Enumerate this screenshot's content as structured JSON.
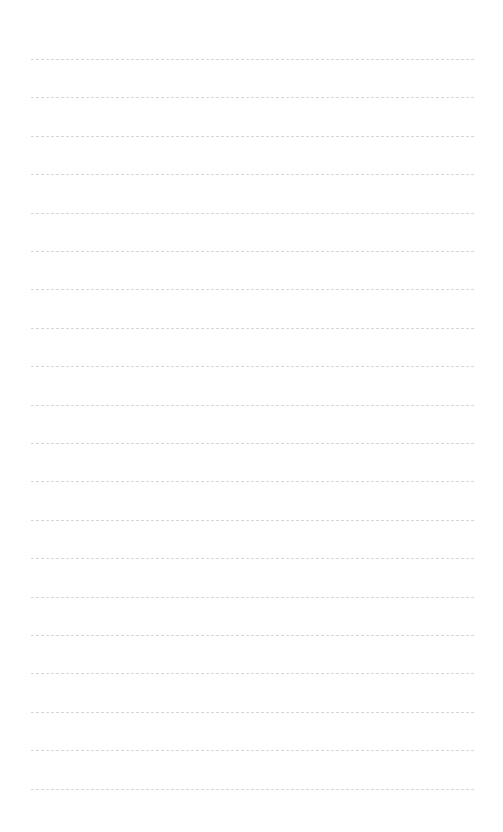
{
  "page": {
    "type": "lined-paper",
    "background": "#ffffff",
    "line_color": "#d6d6d6",
    "line_style": "dashed",
    "line_count": 20,
    "first_line_y": 59,
    "line_spacing": 38.4,
    "lines": [
      "",
      "",
      "",
      "",
      "",
      "",
      "",
      "",
      "",
      "",
      "",
      "",
      "",
      "",
      "",
      "",
      "",
      "",
      "",
      ""
    ]
  }
}
